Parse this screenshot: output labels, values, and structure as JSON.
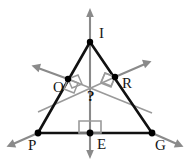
{
  "figure": {
    "canvas": {
      "width": 190,
      "height": 162
    },
    "colors": {
      "triangle_stroke": "#111111",
      "bisector_ray": "#8a8a8a",
      "construction_line": "#9a9a9a",
      "point_fill": "#000000",
      "label_text": "#161616",
      "background": "#ffffff"
    },
    "points": [
      {
        "name": "I",
        "label": "I",
        "x": 90,
        "y": 42,
        "label_x": 99,
        "label_y": 26
      },
      {
        "name": "O",
        "label": "O",
        "x": 68,
        "y": 79,
        "label_x": 53,
        "label_y": 80
      },
      {
        "name": "R",
        "label": "R",
        "x": 115,
        "y": 77,
        "label_x": 122,
        "label_y": 76
      },
      {
        "name": "P",
        "label": "P",
        "x": 38,
        "y": 133,
        "label_x": 28,
        "label_y": 138
      },
      {
        "name": "E",
        "label": "E",
        "x": 90,
        "y": 133,
        "label_x": 97,
        "label_y": 137
      },
      {
        "name": "G",
        "label": "G",
        "x": 152,
        "y": 133,
        "label_x": 155,
        "label_y": 138
      }
    ],
    "unknown_marker": {
      "name": "circumcenter-query",
      "label": "?",
      "x": 87,
      "y": 89
    },
    "segments": [
      {
        "name": "side-PI",
        "from": "P",
        "to": "I"
      },
      {
        "name": "side-IG",
        "from": "I",
        "to": "G"
      },
      {
        "name": "side-PG",
        "from": "P",
        "to": "G"
      }
    ],
    "right_angle_markers": [
      {
        "name": "right-angle-at-O",
        "at": "O"
      },
      {
        "name": "right-angle-at-R",
        "at": "R"
      },
      {
        "name": "right-angle-at-E",
        "at": "E"
      }
    ],
    "rays": [
      {
        "name": "bisector-ray-through-O",
        "through": "O",
        "direction": "up-left and down-right"
      },
      {
        "name": "bisector-ray-through-R",
        "through": "R",
        "direction": "up-right and down-left"
      },
      {
        "name": "bisector-ray-through-E",
        "through": "E",
        "direction": "up and down (vertical)"
      },
      {
        "name": "extension-ray-at-P",
        "through": "P",
        "direction": "down-left"
      },
      {
        "name": "extension-ray-at-G",
        "through": "G",
        "direction": "down-right"
      }
    ]
  }
}
